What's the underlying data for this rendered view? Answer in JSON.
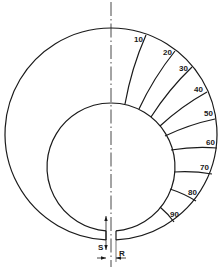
{
  "diagram": {
    "type": "ring-gauge-with-graduated-sectors",
    "outer_circle": {
      "cx": 111,
      "cy": 134,
      "r": 106
    },
    "inner_circle": {
      "cx": 111,
      "cy": 167,
      "r": 64
    },
    "gap": {
      "left_x": 106,
      "right_x": 116
    },
    "centerline_x": 111,
    "graduations": [
      {
        "label": "10",
        "x1": 125,
        "y1": 104,
        "x2": 146,
        "y2": 35,
        "lx": 134,
        "ly": 42
      },
      {
        "label": "20",
        "x1": 139,
        "y1": 109,
        "x2": 175,
        "y2": 51,
        "lx": 163,
        "ly": 55
      },
      {
        "label": "30",
        "x1": 151,
        "y1": 117,
        "x2": 192,
        "y2": 67,
        "lx": 179,
        "ly": 71
      },
      {
        "label": "40",
        "x1": 160,
        "y1": 126,
        "x2": 207,
        "y2": 92,
        "lx": 194,
        "ly": 92
      },
      {
        "label": "50",
        "x1": 165,
        "y1": 136,
        "x2": 215,
        "y2": 119,
        "lx": 204,
        "ly": 116
      },
      {
        "label": "60",
        "x1": 171,
        "y1": 150,
        "x2": 217,
        "y2": 148,
        "lx": 206,
        "ly": 145
      },
      {
        "label": "70",
        "x1": 174,
        "y1": 172,
        "x2": 212,
        "y2": 174,
        "lx": 200,
        "ly": 170
      },
      {
        "label": "80",
        "x1": 170,
        "y1": 189,
        "x2": 196,
        "y2": 201,
        "lx": 188,
        "ly": 195
      },
      {
        "label": "90",
        "x1": 160,
        "y1": 207,
        "x2": 174,
        "y2": 222,
        "lx": 170,
        "ly": 217
      }
    ],
    "dimension_labels": {
      "s": "S",
      "r": "R"
    }
  }
}
